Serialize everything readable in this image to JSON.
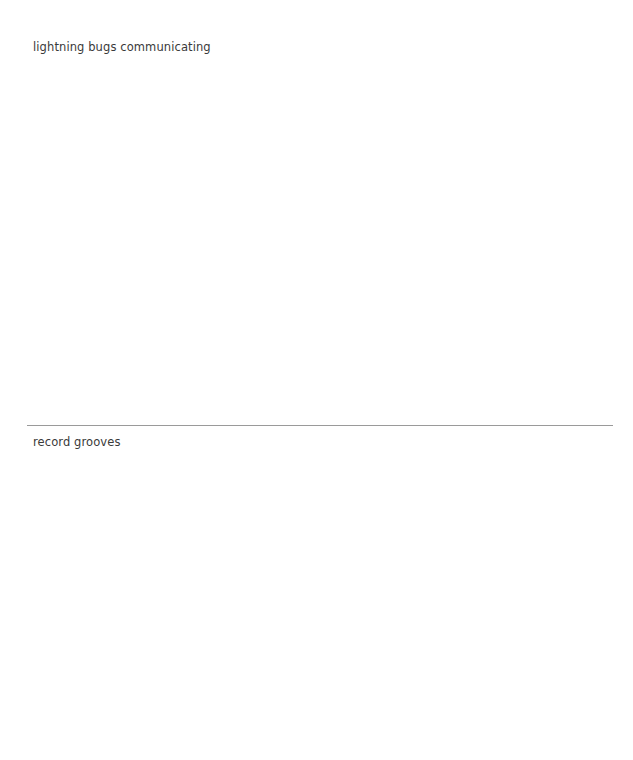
{
  "sections": [
    {
      "caption": "lightning bugs communicating"
    },
    {
      "caption": "record grooves"
    }
  ],
  "colors": {
    "background": "#ffffff",
    "text": "#3a3a3a",
    "divider": "#9a9a9a"
  }
}
